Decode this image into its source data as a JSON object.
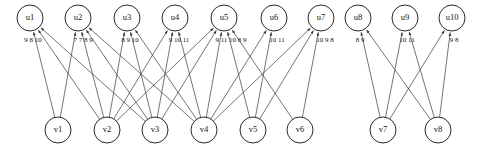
{
  "diagram": {
    "type": "bipartite-graph",
    "title": "",
    "top_nodes": [
      {
        "id": "u1",
        "label": "u1",
        "x": 30,
        "y": 18,
        "r": 13
      },
      {
        "id": "u2",
        "label": "u2",
        "x": 78,
        "y": 18,
        "r": 13
      },
      {
        "id": "u3",
        "label": "u3",
        "x": 127,
        "y": 18,
        "r": 13
      },
      {
        "id": "u4",
        "label": "u4",
        "x": 175,
        "y": 18,
        "r": 13
      },
      {
        "id": "u5",
        "label": "u5",
        "x": 224,
        "y": 18,
        "r": 13
      },
      {
        "id": "u6",
        "label": "u6",
        "x": 274,
        "y": 18,
        "r": 13
      },
      {
        "id": "u7",
        "label": "u7",
        "x": 321,
        "y": 18,
        "r": 13
      },
      {
        "id": "u8",
        "label": "u8",
        "x": 358,
        "y": 18,
        "r": 13
      },
      {
        "id": "u9",
        "label": "u9",
        "x": 405,
        "y": 18,
        "r": 13
      },
      {
        "id": "u10",
        "label": "u10",
        "x": 452,
        "y": 18,
        "r": 13
      }
    ],
    "bottom_nodes": [
      {
        "id": "v1",
        "label": "v1",
        "x": 58,
        "y": 130,
        "r": 13
      },
      {
        "id": "v2",
        "label": "v2",
        "x": 107,
        "y": 130,
        "r": 13
      },
      {
        "id": "v3",
        "label": "v3",
        "x": 155,
        "y": 130,
        "r": 13
      },
      {
        "id": "v4",
        "label": "v4",
        "x": 204,
        "y": 130,
        "r": 13
      },
      {
        "id": "v5",
        "label": "v5",
        "x": 253,
        "y": 130,
        "r": 13
      },
      {
        "id": "v6",
        "label": "v6",
        "x": 300,
        "y": 130,
        "r": 13
      },
      {
        "id": "v7",
        "label": "v7",
        "x": 383,
        "y": 130,
        "r": 13
      },
      {
        "id": "v8",
        "label": "v8",
        "x": 438,
        "y": 130,
        "r": 13
      }
    ],
    "edges": [
      {
        "from": "v1",
        "to": "u1",
        "weight": "9"
      },
      {
        "from": "v2",
        "to": "u1",
        "weight": "8"
      },
      {
        "from": "v3",
        "to": "u1",
        "weight": "10"
      },
      {
        "from": "v1",
        "to": "u2",
        "weight": "7"
      },
      {
        "from": "v2",
        "to": "u2",
        "weight": "7"
      },
      {
        "from": "v3",
        "to": "u2",
        "weight": "8"
      },
      {
        "from": "v4",
        "to": "u2",
        "weight": "9"
      },
      {
        "from": "v2",
        "to": "u3",
        "weight": "8"
      },
      {
        "from": "v3",
        "to": "u3",
        "weight": "9"
      },
      {
        "from": "v4",
        "to": "u3",
        "weight": "10"
      },
      {
        "from": "v2",
        "to": "u4",
        "weight": "9"
      },
      {
        "from": "v3",
        "to": "u4",
        "weight": "10"
      },
      {
        "from": "v4",
        "to": "u4",
        "weight": "11"
      },
      {
        "from": "v2",
        "to": "u5",
        "weight": "9"
      },
      {
        "from": "v3",
        "to": "u5",
        "weight": "11"
      },
      {
        "from": "v4",
        "to": "u5",
        "weight": "10"
      },
      {
        "from": "v5",
        "to": "u5",
        "weight": "8"
      },
      {
        "from": "v6",
        "to": "u5",
        "weight": "9"
      },
      {
        "from": "v4",
        "to": "u6",
        "weight": "10"
      },
      {
        "from": "v5",
        "to": "u6",
        "weight": "11"
      },
      {
        "from": "v4",
        "to": "u7",
        "weight": "10"
      },
      {
        "from": "v5",
        "to": "u7",
        "weight": "9"
      },
      {
        "from": "v6",
        "to": "u7",
        "weight": "8"
      },
      {
        "from": "v7",
        "to": "u8",
        "weight": "8"
      },
      {
        "from": "v8",
        "to": "u8",
        "weight": "9"
      },
      {
        "from": "v7",
        "to": "u9",
        "weight": "10"
      },
      {
        "from": "v8",
        "to": "u9",
        "weight": "11"
      },
      {
        "from": "v7",
        "to": "u10",
        "weight": "9"
      },
      {
        "from": "v8",
        "to": "u10",
        "weight": "8"
      }
    ],
    "weight_labels": [
      {
        "id": "u1-w",
        "text": "9 8 10",
        "x": 33,
        "y": 42
      },
      {
        "id": "u2-w",
        "text": "7 7 8 9",
        "x": 83,
        "y": 42
      },
      {
        "id": "u3-w",
        "text": "8 9 10",
        "x": 130,
        "y": 42
      },
      {
        "id": "u4-w",
        "text": "9 10 11",
        "x": 179,
        "y": 42
      },
      {
        "id": "u5-w",
        "text": "9 11 10 8 9",
        "x": 231,
        "y": 42
      },
      {
        "id": "u6-w",
        "text": "10 11",
        "x": 277,
        "y": 42
      },
      {
        "id": "u7-w",
        "text": "10 9 8",
        "x": 325,
        "y": 42
      },
      {
        "id": "u8-w",
        "text": "8 9",
        "x": 360,
        "y": 42
      },
      {
        "id": "u9-w",
        "text": "10 11",
        "x": 407,
        "y": 42
      },
      {
        "id": "u10-w",
        "text": "9 8",
        "x": 454,
        "y": 42
      }
    ],
    "colors": {
      "node_stroke": "#2b2b2b",
      "node_fill": "#ffffff",
      "edge": "#3a3a3a",
      "text": "#111111",
      "background": "#ffffff"
    }
  }
}
